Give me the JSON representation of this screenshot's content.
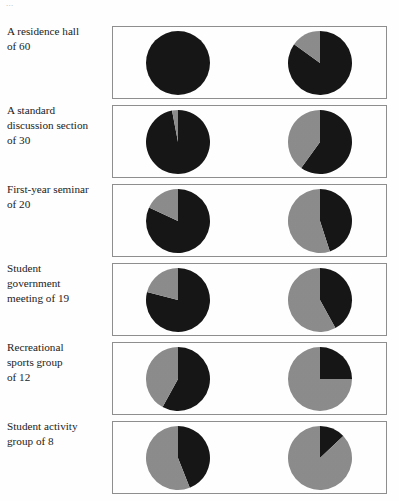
{
  "figure": {
    "top_clipped_text": "...",
    "colors": {
      "black_slice": "#161616",
      "gray_slice": "#8c8c8c",
      "panel_border": "#8f8f8f",
      "background": "#ffffff",
      "label_text": "#222222"
    }
  },
  "chart_data": {
    "type": "pie",
    "title": "",
    "subtitle": "",
    "legend": [
      "black",
      "gray"
    ],
    "legend_position": "none",
    "row_label_header": "",
    "categories": [
      "A residence hall of 60",
      "A standard discussion section of 30",
      "First-year seminar of 20",
      "Student government meeting of 19",
      "Recreational sports group of 12",
      "Student activity group of 8"
    ],
    "rows": [
      {
        "label_lines": [
          "A residence hall",
          "of 60"
        ],
        "group_size": 60,
        "pies": [
          {
            "position": "left",
            "black_pct": 100,
            "gray_pct": 0
          },
          {
            "position": "right",
            "black_pct": 85,
            "gray_pct": 15
          }
        ]
      },
      {
        "label_lines": [
          "A standard",
          "discussion section",
          "of 30"
        ],
        "group_size": 30,
        "pies": [
          {
            "position": "left",
            "black_pct": 97,
            "gray_pct": 3
          },
          {
            "position": "right",
            "black_pct": 60,
            "gray_pct": 40
          }
        ]
      },
      {
        "label_lines": [
          "First-year seminar",
          "of 20"
        ],
        "group_size": 20,
        "pies": [
          {
            "position": "left",
            "black_pct": 82,
            "gray_pct": 18
          },
          {
            "position": "right",
            "black_pct": 45,
            "gray_pct": 55
          }
        ]
      },
      {
        "label_lines": [
          "Student",
          "government",
          "meeting of 19"
        ],
        "group_size": 19,
        "pies": [
          {
            "position": "left",
            "black_pct": 79,
            "gray_pct": 21
          },
          {
            "position": "right",
            "black_pct": 42,
            "gray_pct": 58
          }
        ]
      },
      {
        "label_lines": [
          "Recreational",
          "sports group",
          "of 12"
        ],
        "group_size": 12,
        "pies": [
          {
            "position": "left",
            "black_pct": 58,
            "gray_pct": 42
          },
          {
            "position": "right",
            "black_pct": 25,
            "gray_pct": 75
          }
        ]
      },
      {
        "label_lines": [
          "Student activity",
          "group of 8"
        ],
        "group_size": 8,
        "pies": [
          {
            "position": "left",
            "black_pct": 44,
            "gray_pct": 56
          },
          {
            "position": "right",
            "black_pct": 13,
            "gray_pct": 87
          }
        ]
      }
    ]
  }
}
